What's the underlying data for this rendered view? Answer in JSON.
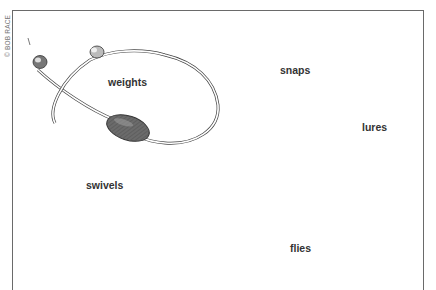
{
  "illustration": {
    "title": "Fishing terminal tackle",
    "credit": "© BOB RACE",
    "labels": {
      "weights": "weights",
      "snaps": "snaps",
      "lures": "lures",
      "swivels": "swivels",
      "flies": "flies"
    },
    "colors": {
      "ink": "#333333",
      "frame": "#6a6a6a",
      "background": "#ffffff"
    }
  }
}
